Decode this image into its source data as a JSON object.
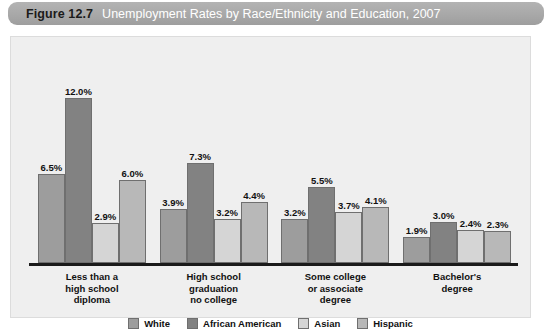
{
  "title": {
    "figure_number": "Figure 12.7",
    "text": "Unemployment Rates by Race/Ethnicity and Education, 2007"
  },
  "chart_data": {
    "type": "bar",
    "title": "Unemployment Rates by Race/Ethnicity and Education, 2007",
    "xlabel": "",
    "ylabel": "",
    "ylim": [
      0,
      13
    ],
    "grid": false,
    "legend_position": "bottom",
    "value_suffix": "%",
    "categories": [
      "Less than a\nhigh school\ndiploma",
      "High school\ngraduation\nno college",
      "Some college\nor associate\ndegree",
      "Bachelor's\ndegree"
    ],
    "category_lines": [
      [
        "Less than a",
        "high school",
        "diploma"
      ],
      [
        "High school",
        "graduation",
        "no college"
      ],
      [
        "Some college",
        "or associate",
        "degree"
      ],
      [
        "Bachelor's",
        "degree"
      ]
    ],
    "series": [
      {
        "name": "White",
        "color": "#9d9d9d",
        "values": [
          6.5,
          3.9,
          3.2,
          1.9
        ],
        "labels": [
          "6.5%",
          "3.9%",
          "3.2%",
          "1.9%"
        ]
      },
      {
        "name": "African American",
        "color": "#828282",
        "values": [
          12.0,
          7.3,
          5.5,
          3.0
        ],
        "labels": [
          "12.0%",
          "7.3%",
          "5.5%",
          "3.0%"
        ]
      },
      {
        "name": "Asian",
        "color": "#d5d5d5",
        "values": [
          2.9,
          3.2,
          3.7,
          2.4
        ],
        "labels": [
          "2.9%",
          "3.2%",
          "3.7%",
          "2.4%"
        ]
      },
      {
        "name": "Hispanic",
        "color": "#b8b8b8",
        "values": [
          6.0,
          4.4,
          4.1,
          2.3
        ],
        "labels": [
          "6.0%",
          "4.4%",
          "4.1%",
          "2.3%"
        ]
      }
    ]
  },
  "legend": [
    {
      "label": "White",
      "color": "#9d9d9d"
    },
    {
      "label": "African American",
      "color": "#828282"
    },
    {
      "label": "Asian",
      "color": "#d5d5d5"
    },
    {
      "label": "Hispanic",
      "color": "#b8b8b8"
    }
  ]
}
